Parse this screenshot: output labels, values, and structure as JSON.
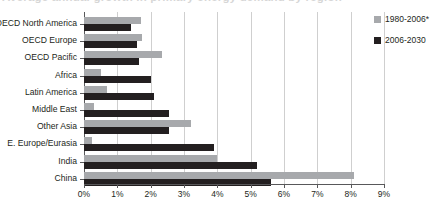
{
  "figure": {
    "title_fragment": "Average annual growth in primary energy demand by region"
  },
  "legend": {
    "position": "right",
    "items": [
      {
        "label": "1980-2006*",
        "color": "#a7a9ac",
        "key": "past"
      },
      {
        "label": "2006-2030",
        "color": "#231f20",
        "key": "future"
      }
    ]
  },
  "axis": {
    "x_ticks": [
      "0%",
      "1%",
      "2%",
      "3%",
      "4%",
      "5%",
      "6%",
      "7%",
      "8%",
      "9%"
    ]
  },
  "chart_data": {
    "type": "bar",
    "orientation": "horizontal",
    "title": "Average annual growth in primary energy demand by region",
    "xlabel": "",
    "ylabel": "",
    "xlim": [
      0,
      9
    ],
    "grid": true,
    "legend_position": "right",
    "categories": [
      "OECD North America",
      "OECD Europe",
      "OECD Pacific",
      "Africa",
      "Latin America",
      "Middle East",
      "Other Asia",
      "E. Europe/Eurasia",
      "India",
      "China"
    ],
    "series": [
      {
        "name": "1980-2006*",
        "color": "#a7a9ac",
        "values": [
          1.7,
          1.75,
          2.35,
          0.5,
          0.7,
          0.3,
          3.2,
          0.25,
          4.0,
          8.1
        ]
      },
      {
        "name": "2006-2030",
        "color": "#231f20",
        "values": [
          1.4,
          1.6,
          1.65,
          2.0,
          2.1,
          2.55,
          2.55,
          3.9,
          5.2,
          5.6
        ]
      }
    ]
  }
}
